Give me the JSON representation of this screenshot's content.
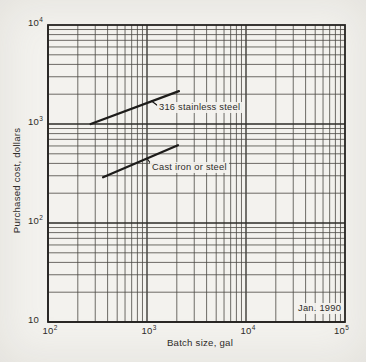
{
  "figure": {
    "background_color": "#f3f2ee",
    "ink_color": "#2e2c29"
  },
  "chart_data": {
    "type": "line",
    "x_scale": "log",
    "y_scale": "log",
    "xlim": [
      100,
      100000
    ],
    "ylim": [
      10,
      10000
    ],
    "xlabel": "Batch size, gal",
    "ylabel": "Purchased cost, dollars",
    "grid": "full log-log grid, major decade lines plus minor lines 2-9 in every decade, both axes",
    "legend_position": "labels beside lines with leader ticks",
    "annotation": "Jan. 1990",
    "x_ticks": [
      {
        "value": 100,
        "label": "10^2",
        "mantissa": "10",
        "exponent": "2"
      },
      {
        "value": 1000,
        "label": "10^3",
        "mantissa": "10",
        "exponent": "3"
      },
      {
        "value": 10000,
        "label": "10^4",
        "mantissa": "10",
        "exponent": "4"
      },
      {
        "value": 100000,
        "label": "10^5",
        "mantissa": "10",
        "exponent": "5"
      }
    ],
    "y_ticks": [
      {
        "value": 10,
        "label": "10",
        "mantissa": "10",
        "exponent": ""
      },
      {
        "value": 100,
        "label": "10^2",
        "mantissa": "10",
        "exponent": "2"
      },
      {
        "value": 1000,
        "label": "10^3",
        "mantissa": "10",
        "exponent": "3"
      },
      {
        "value": 10000,
        "label": "10^4",
        "mantissa": "10",
        "exponent": "4"
      }
    ],
    "series": [
      {
        "name": "316 stainless steel",
        "points": [
          [
            270,
            1000
          ],
          [
            2100,
            2150
          ]
        ]
      },
      {
        "name": "Cast iron or steel",
        "points": [
          [
            360,
            290
          ],
          [
            2050,
            610
          ]
        ]
      }
    ]
  }
}
